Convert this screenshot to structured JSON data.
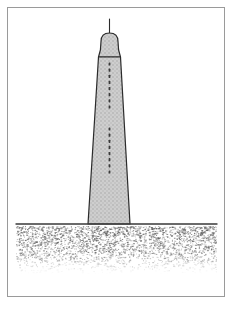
{
  "figure": {
    "title": "Tower on stippled ground",
    "style": "hand-drawn pen-and-ink line illustration",
    "background_color": "#ffffff",
    "frame": {
      "name": "figure-border",
      "color": "#9a9a9a",
      "stroke_width": 1,
      "x": 7,
      "y": 7,
      "width": 218,
      "height": 290
    },
    "canvas": {
      "width": 234,
      "height": 311
    }
  },
  "tower": {
    "name": "tower",
    "outline_color": "#2b2b2b",
    "fill_color": "#c9c9c9",
    "fill_texture": "stipple-halftone",
    "stroke_width": 1.2,
    "shaft": {
      "top_y": 57,
      "base_y": 224,
      "top_left_x": 98.5,
      "top_right_x": 120.5,
      "base_left_x": 88,
      "base_right_x": 130
    },
    "cap": {
      "name": "tower-cap",
      "top_y": 33,
      "bottom_y": 57,
      "left_x": 101,
      "right_x": 118,
      "dome_radius": 8.5,
      "collar_y": 50
    },
    "antenna": {
      "name": "antenna-spire",
      "x": 109.5,
      "top_y": 19,
      "bottom_y": 34,
      "stroke_width": 1.1,
      "color": "#2b2b2b"
    },
    "windows": {
      "name": "window-dots",
      "color": "#3a3a3a",
      "center_x": 109.5,
      "groups": [
        {
          "label": "upper",
          "start_y": 64,
          "end_y": 107,
          "count": 8,
          "dot_w": 1.8,
          "dot_h": 3.2
        },
        {
          "label": "lower",
          "start_y": 129,
          "end_y": 172,
          "count": 8,
          "dot_w": 1.8,
          "dot_h": 3.2
        }
      ]
    }
  },
  "ground": {
    "name": "ground",
    "line": {
      "name": "ground-line",
      "y": 224,
      "x_start": 16,
      "x_end": 217,
      "color": "#3a3a3a",
      "stroke_width": 1.4
    },
    "stipple_band": {
      "name": "ground-stipple",
      "x_start": 16,
      "x_end": 217,
      "y_start": 226,
      "y_end": 274,
      "dot_color": "#585858",
      "density_top": 1.0,
      "density_bottom": 0.12,
      "dot_count": 2600
    }
  }
}
